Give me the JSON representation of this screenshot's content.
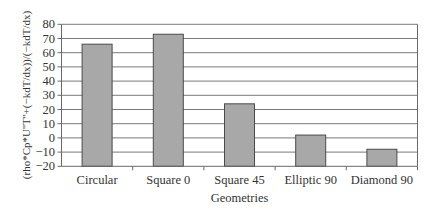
{
  "chart_data": {
    "type": "bar",
    "title": "",
    "xlabel": "Geometries",
    "ylabel": "(rho*Cp*U''T''+(−kdT/dx))/(−kdT/dx)",
    "categories": [
      "Circular",
      "Square 0",
      "Square 45",
      "Elliptic 90",
      "Diamond 90"
    ],
    "values": [
      66,
      73,
      24,
      2,
      -8
    ],
    "ylim": [
      -20,
      80
    ],
    "yticks": [
      80,
      70,
      60,
      50,
      40,
      30,
      20,
      10,
      0,
      -10,
      -20
    ],
    "ytick_labels": [
      "80",
      "70",
      "60",
      "50",
      "40",
      "30",
      "20",
      "10",
      "0",
      "−10",
      "−20"
    ],
    "grid": true,
    "legend": null,
    "bar_baseline": -20
  },
  "colors": {
    "bar_fill": "#a8a8a8",
    "bar_stroke": "#4a4a4a",
    "grid": "#7a7a7a",
    "axis": "#6a6a6a",
    "text": "#333333"
  }
}
